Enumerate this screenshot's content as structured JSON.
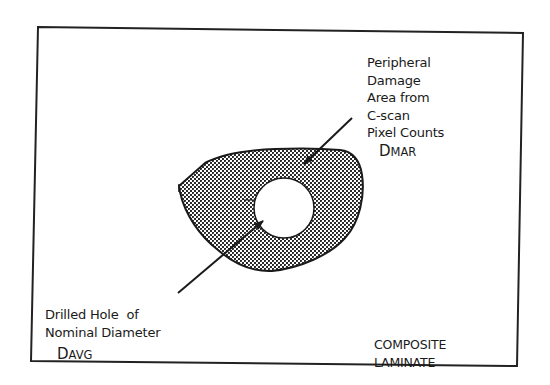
{
  "diagram": {
    "colors": {
      "ink": "#1a1a1a",
      "background": "#ffffff",
      "hatch_light": "#ffffff",
      "hatch_dark": "#333333"
    },
    "frame": {
      "label": "composite laminate panel"
    },
    "damage_label": {
      "lines": [
        "Peripheral",
        "Damage",
        "Area from",
        "C-scan",
        "Pixel Counts"
      ],
      "symbol_main": "D",
      "symbol_sub": "MAR"
    },
    "hole_label": {
      "lines": [
        "Drilled Hole  of",
        "Nominal Diameter"
      ],
      "symbol_main": "D",
      "symbol_sub": "AVG"
    },
    "material_label": {
      "lines": [
        "COMPOSITE",
        "LAMINATE"
      ]
    }
  }
}
